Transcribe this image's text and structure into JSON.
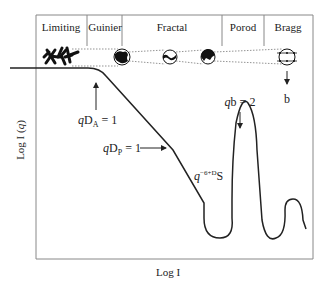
{
  "regions": [
    {
      "label": "Limiting"
    },
    {
      "label": "Guinier"
    },
    {
      "label": "Fractal"
    },
    {
      "label": "Porod"
    },
    {
      "label": "Bragg"
    }
  ],
  "axes": {
    "xlabel": "Log I",
    "ylabel_main": "Log I (",
    "ylabel_var": "q",
    "ylabel_close": ")"
  },
  "annotations": {
    "qDA": {
      "q": "q",
      "D": "D",
      "sub": "A",
      "rest": " = 1"
    },
    "qDP": {
      "q": "q",
      "D": "D",
      "sub": "P",
      "rest": " = 1"
    },
    "slope": {
      "q": "q",
      "sup1": "−6+",
      "supD": "D",
      "S": "S"
    },
    "qb": {
      "q": "q",
      "rest": "b = 2"
    },
    "bragg_b": "b"
  },
  "colors": {
    "frame": "#888888",
    "curve": "#222222",
    "text": "#222222"
  }
}
